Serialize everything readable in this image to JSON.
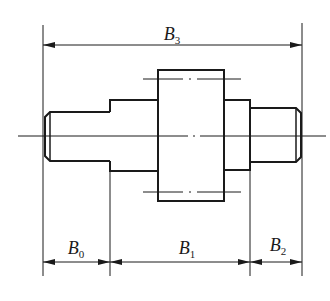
{
  "diagram": {
    "type": "stepped-shaft-dimension-drawing",
    "colors": {
      "line": "#1a1a1a",
      "background": "#ffffff"
    },
    "dimensions": [
      {
        "id": "B3",
        "letter": "B",
        "subscript": "3",
        "span": "overall length"
      },
      {
        "id": "B0",
        "letter": "B",
        "subscript": "0",
        "span": "left segment"
      },
      {
        "id": "B1",
        "letter": "B",
        "subscript": "1",
        "span": "middle segment"
      },
      {
        "id": "B2",
        "letter": "B",
        "subscript": "2",
        "span": "right segment"
      }
    ]
  },
  "labels": {
    "b3": {
      "letter": "B",
      "sub": "3"
    },
    "b0": {
      "letter": "B",
      "sub": "0"
    },
    "b1": {
      "letter": "B",
      "sub": "1"
    },
    "b2": {
      "letter": "B",
      "sub": "2"
    }
  }
}
